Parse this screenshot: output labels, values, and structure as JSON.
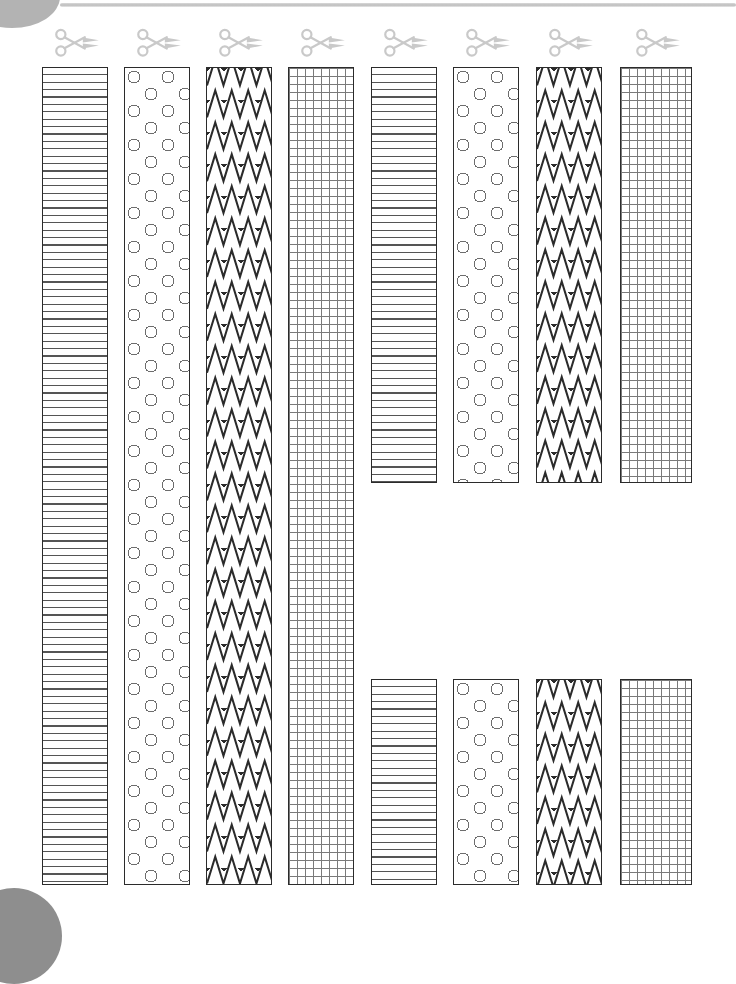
{
  "page": {
    "background_color": "#ffffff",
    "width": 736,
    "height": 923,
    "decorations": {
      "top_rule_color": "#bdbdbd",
      "corner_blob_top_left_color": "#b3b3b3",
      "corner_blob_bottom_left_color": "#8e8e8e"
    }
  },
  "icons": {
    "scissors": "scissors-icon",
    "scissors_color": "#c9c9c9",
    "scissors_count": 8
  },
  "patterns": {
    "lines": {
      "name": "horizontal-lines",
      "stroke": "#555555",
      "spacing_px": 7
    },
    "circles": {
      "name": "circles-polka",
      "stroke": "#6d6d6d",
      "diameter_px": 13,
      "spacing_px": 17
    },
    "zigzag": {
      "name": "zigzag-chevron",
      "stroke": "#2b2b2b",
      "period_px": 17,
      "row_height_px": 32
    },
    "grid": {
      "name": "graph-grid",
      "minor_stroke": "#7a7a7a",
      "major_stroke": "#3a3a3a",
      "minor_px": 8,
      "major_px": 16
    }
  },
  "strips": [
    {
      "id": "strip-1",
      "column": 1,
      "pattern": "lines",
      "label": "Strip 1 - horizontal lines",
      "x": 42,
      "width": 66,
      "segments": [
        {
          "y": 67,
          "height": 818
        }
      ]
    },
    {
      "id": "strip-2",
      "column": 2,
      "pattern": "circles",
      "label": "Strip 2 - circles",
      "x": 124,
      "width": 66,
      "segments": [
        {
          "y": 67,
          "height": 818
        }
      ]
    },
    {
      "id": "strip-3",
      "column": 3,
      "pattern": "zigzag",
      "label": "Strip 3 - zigzag",
      "x": 206,
      "width": 66,
      "segments": [
        {
          "y": 67,
          "height": 818
        }
      ]
    },
    {
      "id": "strip-4",
      "column": 4,
      "pattern": "grid",
      "label": "Strip 4 - graph grid",
      "x": 288,
      "width": 66,
      "segments": [
        {
          "y": 67,
          "height": 818
        }
      ]
    },
    {
      "id": "strip-5",
      "column": 5,
      "pattern": "lines",
      "label": "Strip 5 - horizontal lines",
      "x": 371,
      "width": 66,
      "segments": [
        {
          "y": 67,
          "height": 416
        },
        {
          "y": 679,
          "height": 206
        }
      ]
    },
    {
      "id": "strip-6",
      "column": 6,
      "pattern": "circles",
      "label": "Strip 6 - circles",
      "x": 453,
      "width": 66,
      "segments": [
        {
          "y": 67,
          "height": 416
        },
        {
          "y": 679,
          "height": 206
        }
      ]
    },
    {
      "id": "strip-7",
      "column": 7,
      "pattern": "zigzag",
      "label": "Strip 7 - zigzag",
      "x": 536,
      "width": 66,
      "segments": [
        {
          "y": 67,
          "height": 416
        },
        {
          "y": 679,
          "height": 206
        }
      ]
    },
    {
      "id": "strip-8",
      "column": 8,
      "pattern": "grid",
      "label": "Strip 8 - graph grid",
      "x": 620,
      "width": 72,
      "segments": [
        {
          "y": 67,
          "height": 416
        },
        {
          "y": 679,
          "height": 206
        }
      ]
    }
  ],
  "cut_guides": [
    {
      "id": "cut-1",
      "column": 1,
      "x": 42,
      "y": 28
    },
    {
      "id": "cut-2",
      "column": 2,
      "x": 124,
      "y": 28
    },
    {
      "id": "cut-3",
      "column": 3,
      "x": 206,
      "y": 28
    },
    {
      "id": "cut-4",
      "column": 4,
      "x": 288,
      "y": 28
    },
    {
      "id": "cut-5",
      "column": 5,
      "x": 371,
      "y": 28
    },
    {
      "id": "cut-6",
      "column": 6,
      "x": 453,
      "y": 28
    },
    {
      "id": "cut-7",
      "column": 7,
      "x": 536,
      "y": 28
    },
    {
      "id": "cut-8",
      "column": 8,
      "x": 620,
      "y": 28
    }
  ]
}
